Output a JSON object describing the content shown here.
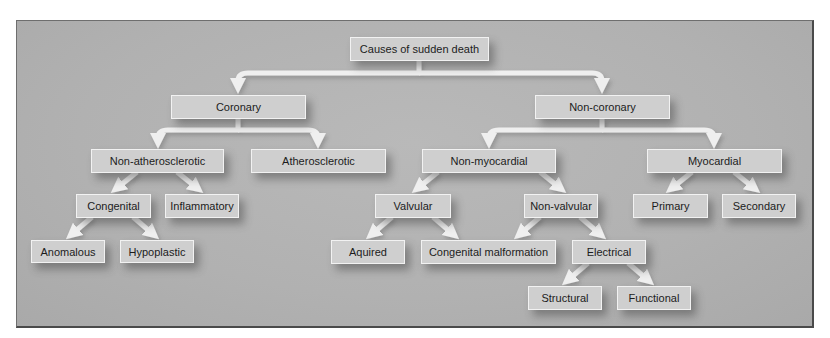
{
  "diagram": {
    "type": "tree",
    "title": "Causes of sudden death",
    "colors": {
      "background": "#b3b3b3",
      "node_fill": "#cfcfcf",
      "node_border": "#f2f2f2",
      "arrow": "#efefef",
      "text": "#1c1c1c"
    },
    "nodes": {
      "root": {
        "label": "Causes of sudden death"
      },
      "coronary": {
        "label": "Coronary"
      },
      "non_coronary": {
        "label": "Non-coronary"
      },
      "non_atherosclerotic": {
        "label": "Non-atherosclerotic"
      },
      "atherosclerotic": {
        "label": "Atherosclerotic"
      },
      "non_myocardial": {
        "label": "Non-myocardial"
      },
      "myocardial": {
        "label": "Myocardial"
      },
      "congenital": {
        "label": "Congenital"
      },
      "inflammatory": {
        "label": "Inflammatory"
      },
      "valvular": {
        "label": "Valvular"
      },
      "non_valvular": {
        "label": "Non-valvular"
      },
      "primary": {
        "label": "Primary"
      },
      "secondary": {
        "label": "Secondary"
      },
      "anomalous": {
        "label": "Anomalous"
      },
      "hypoplastic": {
        "label": "Hypoplastic"
      },
      "aquired": {
        "label": "Aquired"
      },
      "congenital_malformation": {
        "label": "Congenital malformation"
      },
      "electrical": {
        "label": "Electrical"
      },
      "structural": {
        "label": "Structural"
      },
      "functional": {
        "label": "Functional"
      }
    },
    "edges": [
      [
        "root",
        "coronary"
      ],
      [
        "root",
        "non_coronary"
      ],
      [
        "coronary",
        "non_atherosclerotic"
      ],
      [
        "coronary",
        "atherosclerotic"
      ],
      [
        "non_coronary",
        "non_myocardial"
      ],
      [
        "non_coronary",
        "myocardial"
      ],
      [
        "non_atherosclerotic",
        "congenital"
      ],
      [
        "non_atherosclerotic",
        "inflammatory"
      ],
      [
        "congenital",
        "anomalous"
      ],
      [
        "congenital",
        "hypoplastic"
      ],
      [
        "non_myocardial",
        "valvular"
      ],
      [
        "non_myocardial",
        "non_valvular"
      ],
      [
        "valvular",
        "aquired"
      ],
      [
        "valvular",
        "congenital_malformation"
      ],
      [
        "non_valvular",
        "congenital_malformation"
      ],
      [
        "non_valvular",
        "electrical"
      ],
      [
        "electrical",
        "structural"
      ],
      [
        "electrical",
        "functional"
      ],
      [
        "myocardial",
        "primary"
      ],
      [
        "myocardial",
        "secondary"
      ]
    ]
  }
}
